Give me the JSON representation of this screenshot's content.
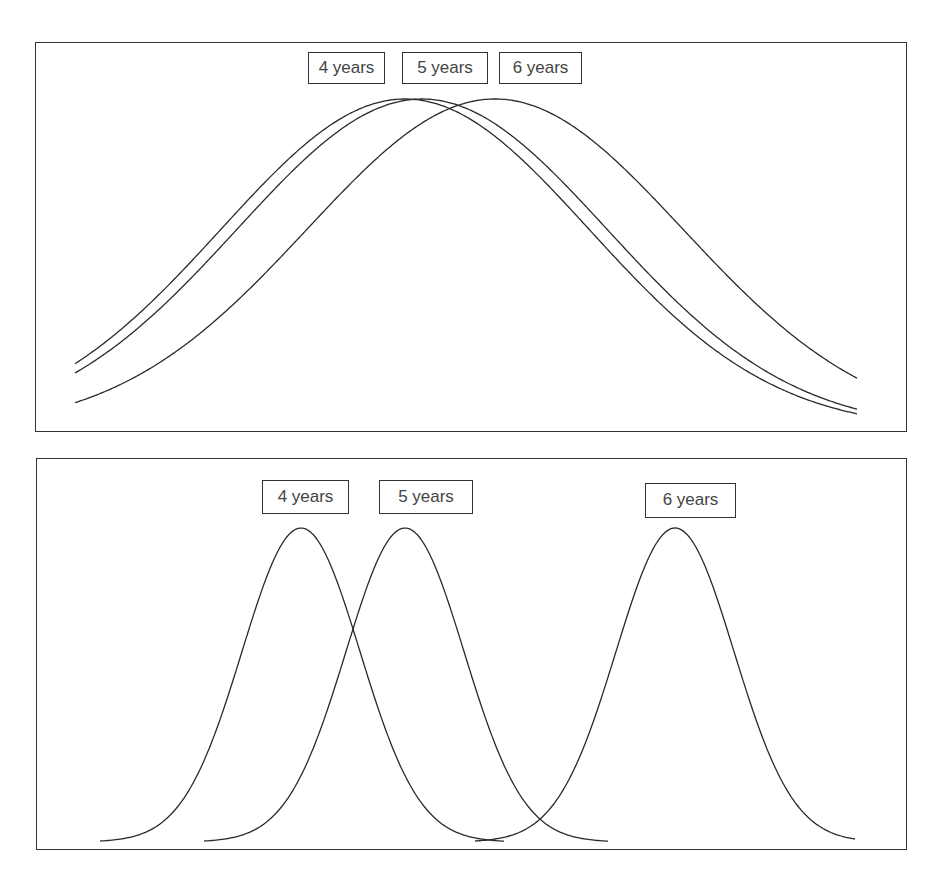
{
  "chart_data": [
    {
      "type": "line",
      "title": "",
      "xlabel": "",
      "ylabel": "",
      "grid": false,
      "description": "Three wide, heavily overlapping bell curves",
      "series": [
        {
          "name": "4 years",
          "center_px": 405,
          "sigma_px": 184,
          "x_range_px": [
            75,
            857
          ],
          "peak_px": 99
        },
        {
          "name": "5 years",
          "center_px": 422,
          "sigma_px": 185,
          "x_range_px": [
            75,
            857
          ],
          "peak_px": 99
        },
        {
          "name": "6 years",
          "center_px": 495,
          "sigma_px": 188,
          "x_range_px": [
            75,
            857
          ],
          "peak_px": 99
        }
      ],
      "baseline_px": 430,
      "labels": [
        {
          "text": "4 years",
          "x": 308,
          "y": 52,
          "w": 77,
          "h": 32
        },
        {
          "text": "5 years",
          "x": 402,
          "y": 52,
          "w": 86,
          "h": 32
        },
        {
          "text": "6 years",
          "x": 499,
          "y": 52,
          "w": 83,
          "h": 32
        }
      ]
    },
    {
      "type": "line",
      "title": "",
      "xlabel": "",
      "ylabel": "",
      "grid": false,
      "description": "Three narrow, well separated bell curves",
      "series": [
        {
          "name": "4 years",
          "center_px": 301,
          "sigma_px": 59,
          "x_range_px": [
            100,
            505
          ],
          "peak_px": 528
        },
        {
          "name": "5 years",
          "center_px": 405,
          "sigma_px": 59,
          "x_range_px": [
            204,
            608
          ],
          "peak_px": 528
        },
        {
          "name": "6 years",
          "center_px": 675,
          "sigma_px": 59,
          "x_range_px": [
            475,
            856
          ],
          "peak_px": 528
        }
      ],
      "baseline_px": 842,
      "labels": [
        {
          "text": "4 years",
          "x": 262,
          "y": 480,
          "w": 87,
          "h": 34
        },
        {
          "text": "5 years",
          "x": 379,
          "y": 480,
          "w": 94,
          "h": 34
        },
        {
          "text": "6 years",
          "x": 645,
          "y": 483,
          "w": 91,
          "h": 35
        }
      ]
    }
  ]
}
